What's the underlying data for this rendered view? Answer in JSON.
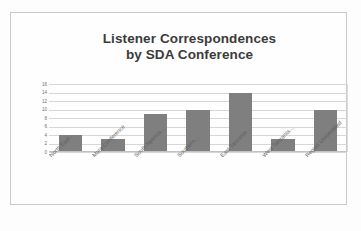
{
  "chart_data": {
    "type": "bar",
    "title": "Listener Correspondences by SDA Conference",
    "title_line1": "Listener Correspondences",
    "title_line2": "by SDA Conference",
    "xlabel": "",
    "ylabel": "",
    "ylim": [
      0,
      16
    ],
    "ytick_labels": [
      "16",
      "14",
      "12",
      "10",
      "8",
      "6",
      "4",
      "2",
      "0"
    ],
    "ytick_values": [
      16,
      14,
      12,
      10,
      8,
      6,
      4,
      2,
      0
    ],
    "grid": true,
    "legend": "none",
    "categories": [
      "North East…",
      "Mara Conference",
      "South Nyanza…",
      "Southern…",
      "East Tanzania…",
      "West Tanzania…",
      "Region Unidentified"
    ],
    "values": [
      4,
      3,
      9,
      10,
      14,
      3,
      10
    ],
    "bar_color": "#7f7f7f",
    "gridline_color": "#d7d7d7",
    "title_color": "#3b3b3b",
    "background_color": "#fefefe"
  },
  "figure": {
    "caption": ""
  }
}
